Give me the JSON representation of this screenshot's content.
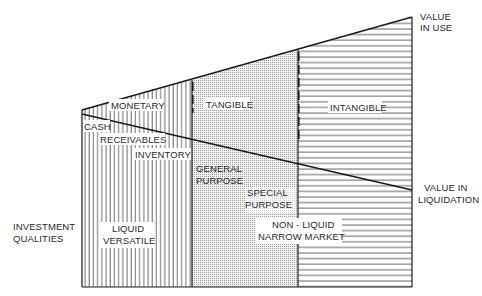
{
  "diagram": {
    "type": "asset-value-investment-qualities",
    "colors": {
      "line": "#1a1a1a",
      "hatch": "#3a3a3a",
      "dot": "#9a9a9a",
      "text": "#2a2a2a",
      "background": "#ffffff"
    },
    "columns": [
      {
        "name": "monetary",
        "label": "MONETARY",
        "pattern": "vertical-lines"
      },
      {
        "name": "tangible",
        "label": "TANGIBLE",
        "pattern": "dots"
      },
      {
        "name": "intangible",
        "label": "INTANGIBLE",
        "pattern": "horizontal-lines"
      }
    ],
    "lines": {
      "value_in_use": {
        "label_line1": "VALUE",
        "label_line2": "IN USE"
      },
      "value_in_liquidation": {
        "label_line1": "VALUE IN",
        "label_line2": "LIQUIDATION"
      }
    },
    "monetary_items": [
      "CASH",
      "RECEIVABLES",
      "INVENTORY"
    ],
    "tangible_items": {
      "general": {
        "line1": "GENERAL",
        "line2": "PURPOSE"
      },
      "special": {
        "line1": "SPECIAL",
        "line2": "PURPOSE"
      }
    },
    "axis_label": {
      "line1": "INVESTMENT",
      "line2": "QUALITIES"
    },
    "qualities": {
      "liquid": {
        "line1": "LIQUID",
        "line2": "VERSATILE"
      },
      "non_liquid": {
        "line1": "NON - LIQUID",
        "line2": "NARROW MARKET"
      }
    }
  }
}
